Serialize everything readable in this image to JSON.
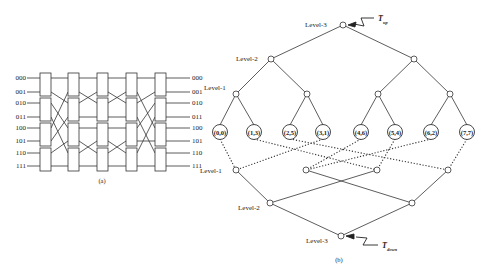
{
  "figure_a": {
    "caption": "(a)",
    "inputs": [
      "000",
      "001",
      "010",
      "011",
      "100",
      "101",
      "110",
      "111"
    ],
    "outputs": [
      "000",
      "001",
      "010",
      "011",
      "100",
      "101",
      "110",
      "111"
    ],
    "stages": 5,
    "switches_per_stage": 4
  },
  "figure_b": {
    "caption": "(b)",
    "labels": {
      "top_level3": "Level-3",
      "top_level2": "Level-2",
      "top_level1": "Level-1",
      "bottom_level1": "Level-1",
      "bottom_level2": "Level-2",
      "bottom_level3": "Level-3"
    },
    "t_up": {
      "main": "T",
      "sub": "up"
    },
    "t_down": {
      "main": "T",
      "sub": "down"
    },
    "leaves": [
      "(0,0)",
      "(1,3)",
      "(2,5)",
      "(3,1)",
      "(4,6)",
      "(5,4)",
      "(6,2)",
      "(7,7)"
    ]
  },
  "colors": {
    "line": "#333333",
    "text": "#222222",
    "background": "#ffffff"
  }
}
